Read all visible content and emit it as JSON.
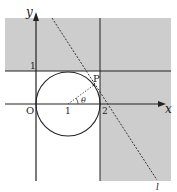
{
  "diagram": {
    "axes": {
      "x_label": "x",
      "y_label": "y",
      "origin_label": "O"
    },
    "ticks": {
      "x_one": "1",
      "x_two": "2",
      "y_one": "1"
    },
    "point_label": "P",
    "angle_label": "θ",
    "line_label": "l",
    "elements": [
      {
        "type": "circle",
        "center": [
          1,
          0
        ],
        "radius": 1
      },
      {
        "type": "line",
        "equation": "x = 2"
      },
      {
        "type": "line",
        "equation": "y = 1"
      },
      {
        "type": "dashed-line",
        "name": "l",
        "tangent_to": "circle",
        "at": "P"
      },
      {
        "type": "shaded-region",
        "description": "y >= 1 or x >= 2"
      }
    ],
    "colors": {
      "shade": "#cdcdcd",
      "stroke": "#222222"
    }
  }
}
